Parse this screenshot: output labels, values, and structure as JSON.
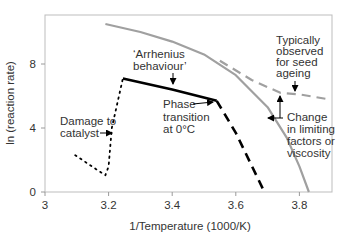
{
  "chart_data": {
    "type": "line",
    "title": "",
    "xlabel": "1/Temperature (1000/K)",
    "ylabel": "ln (reaction rate)",
    "xlim": [
      3.0,
      3.9
    ],
    "ylim": [
      0,
      11
    ],
    "x_ticks": [
      "3",
      "3.2",
      "3.4",
      "3.6",
      "3.8"
    ],
    "x_tick_values": [
      3.0,
      3.2,
      3.4,
      3.6,
      3.8
    ],
    "y_ticks": [
      "0",
      "4",
      "8"
    ],
    "y_tick_values": [
      0,
      4,
      8
    ],
    "grid": false,
    "legend": null,
    "series": [
      {
        "name": "upper-curve",
        "style": "solid",
        "color": "#a0a0a0",
        "points": [
          [
            3.19,
            10.5
          ],
          [
            3.3,
            10.0
          ],
          [
            3.4,
            9.4
          ],
          [
            3.5,
            8.6
          ],
          [
            3.6,
            7.3
          ],
          [
            3.7,
            5.3
          ],
          [
            3.76,
            3.4
          ],
          [
            3.8,
            1.6
          ],
          [
            3.83,
            0.0
          ]
        ]
      },
      {
        "name": "seed-ageing-extension",
        "style": "dashed",
        "color": "#a0a0a0",
        "points": [
          [
            3.55,
            8.2
          ],
          [
            3.65,
            7.0
          ],
          [
            3.74,
            6.2
          ],
          [
            3.8,
            6.1
          ],
          [
            3.89,
            5.8
          ]
        ]
      },
      {
        "name": "arrhenius",
        "style": "solid",
        "color": "#000000",
        "points": [
          [
            3.245,
            7.1
          ],
          [
            3.4,
            6.4
          ],
          [
            3.54,
            5.7
          ]
        ]
      },
      {
        "name": "below-phase-transition",
        "style": "dashed",
        "color": "#000000",
        "points": [
          [
            3.54,
            5.7
          ],
          [
            3.6,
            3.7
          ],
          [
            3.69,
            0.0
          ]
        ]
      },
      {
        "name": "damage-to-catalyst",
        "style": "dotted",
        "color": "#000000",
        "points": [
          [
            3.095,
            2.3
          ],
          [
            3.17,
            1.3
          ],
          [
            3.19,
            1.05
          ],
          [
            3.2,
            1.6
          ],
          [
            3.21,
            4.0
          ],
          [
            3.245,
            7.1
          ]
        ]
      }
    ],
    "annotations": [
      {
        "text": "'Arrhenius behaviour'",
        "lines": [
          "‘Arrhenius",
          "behaviour’"
        ]
      },
      {
        "text": "Phase transition at 0°C",
        "lines": [
          "Phase",
          "transition",
          "at 0°C"
        ]
      },
      {
        "text": "Damage to catalyst",
        "lines": [
          "Damage to",
          "catalyst"
        ]
      },
      {
        "text": "Typically observed for seed ageing",
        "lines": [
          "Typically",
          "observed",
          "for seed",
          "ageing"
        ]
      },
      {
        "text": "Change in limiting factors or viscosity",
        "lines": [
          "Change",
          "in limiting",
          "factors or",
          "viscosity"
        ]
      }
    ]
  }
}
